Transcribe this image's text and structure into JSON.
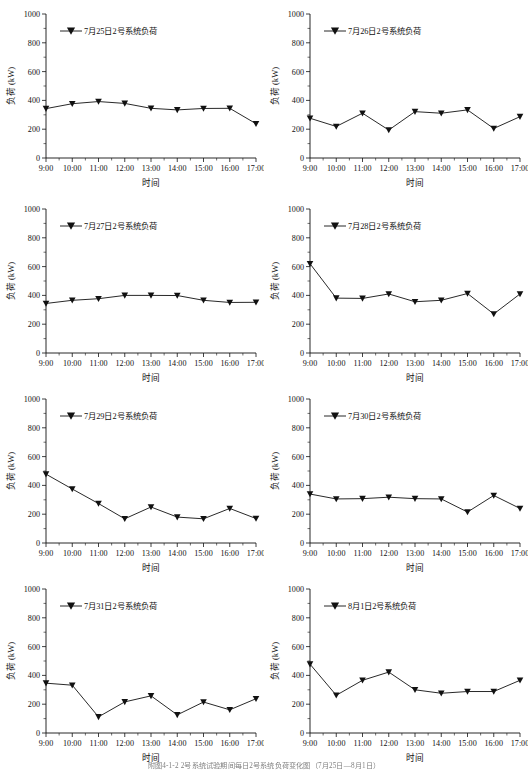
{
  "figure": {
    "caption": "附图4-1-2 2号系统试验期间每日2号系统负荷变化图（7月25日—8月1日）",
    "panel_count": 8,
    "marker_shape": "down-triangle",
    "line_color": "#111111"
  },
  "axes_common": {
    "ylabel": "负荷 (kW)",
    "xlabel": "时间",
    "ylim": [
      0,
      1000
    ],
    "yticks": [
      0,
      200,
      400,
      600,
      800,
      1000
    ],
    "ytick_labels": [
      "0",
      "200",
      "400",
      "600",
      "800",
      "1000"
    ],
    "xtick_labels": [
      "9:00",
      "10:00",
      "11:00",
      "12:00",
      "13:00",
      "14:00",
      "15:00",
      "16:00",
      "17:00"
    ],
    "grid": false,
    "legend_position": "upper-left"
  },
  "chart_data": [
    {
      "type": "line",
      "title": "",
      "legend": "7月25日2号系统负荷",
      "xlabel": "时间",
      "ylabel": "负荷 (kW)",
      "ylim": [
        0,
        1000
      ],
      "x": [
        "9:00",
        "10:00",
        "11:00",
        "12:00",
        "13:00",
        "14:00",
        "15:00",
        "16:00",
        "17:00"
      ],
      "values": [
        343,
        377,
        392,
        379,
        345,
        334,
        344,
        345,
        238
      ]
    },
    {
      "type": "line",
      "title": "",
      "legend": "7月26日2号系统负荷",
      "xlabel": "时间",
      "ylabel": "负荷 (kW)",
      "ylim": [
        0,
        1000
      ],
      "x": [
        "9:00",
        "10:00",
        "11:00",
        "12:00",
        "13:00",
        "14:00",
        "15:00",
        "16:00",
        "17:00"
      ],
      "values": [
        276,
        219,
        311,
        194,
        322,
        311,
        334,
        205,
        287
      ]
    },
    {
      "type": "line",
      "title": "",
      "legend": "7月27日2号系统负荷",
      "xlabel": "时间",
      "ylabel": "负荷 (kW)",
      "ylim": [
        0,
        1000
      ],
      "x": [
        "9:00",
        "10:00",
        "11:00",
        "12:00",
        "13:00",
        "14:00",
        "15:00",
        "16:00",
        "17:00"
      ],
      "values": [
        344,
        366,
        377,
        400,
        400,
        399,
        366,
        351,
        352
      ]
    },
    {
      "type": "line",
      "title": "",
      "legend": "7月28日2号系统负荷",
      "xlabel": "时间",
      "ylabel": "负荷 (kW)",
      "ylim": [
        0,
        1000
      ],
      "x": [
        "9:00",
        "10:00",
        "11:00",
        "12:00",
        "13:00",
        "14:00",
        "15:00",
        "16:00",
        "17:00"
      ],
      "values": [
        620,
        381,
        379,
        410,
        356,
        366,
        413,
        271,
        410
      ]
    },
    {
      "type": "line",
      "title": "",
      "legend": "7月29日2号系统负荷",
      "xlabel": "时间",
      "ylabel": "负荷 (kW)",
      "ylim": [
        0,
        1000
      ],
      "x": [
        "9:00",
        "10:00",
        "11:00",
        "12:00",
        "13:00",
        "14:00",
        "15:00",
        "16:00",
        "17:00"
      ],
      "values": [
        478,
        375,
        274,
        168,
        250,
        180,
        168,
        240,
        170
      ]
    },
    {
      "type": "line",
      "title": "",
      "legend": "7月30日2号系统负荷",
      "xlabel": "时间",
      "ylabel": "负荷 (kW)",
      "ylim": [
        0,
        1000
      ],
      "x": [
        "9:00",
        "10:00",
        "11:00",
        "12:00",
        "13:00",
        "14:00",
        "15:00",
        "16:00",
        "17:00"
      ],
      "values": [
        340,
        306,
        308,
        318,
        308,
        306,
        215,
        330,
        240
      ]
    },
    {
      "type": "line",
      "title": "",
      "legend": "7月31日2号系统负荷",
      "xlabel": "时间",
      "ylabel": "负荷 (kW)",
      "ylim": [
        0,
        1000
      ],
      "x": [
        "9:00",
        "10:00",
        "11:00",
        "12:00",
        "13:00",
        "14:00",
        "15:00",
        "16:00",
        "17:00"
      ],
      "values": [
        346,
        332,
        112,
        216,
        258,
        126,
        215,
        161,
        238
      ]
    },
    {
      "type": "line",
      "title": "",
      "legend": "8月1日2号系统负荷",
      "xlabel": "时间",
      "ylabel": "负荷 (kW)",
      "ylim": [
        0,
        1000
      ],
      "x": [
        "9:00",
        "10:00",
        "11:00",
        "12:00",
        "13:00",
        "14:00",
        "15:00",
        "16:00",
        "17:00"
      ],
      "values": [
        478,
        262,
        366,
        423,
        300,
        276,
        288,
        288,
        366
      ]
    }
  ]
}
